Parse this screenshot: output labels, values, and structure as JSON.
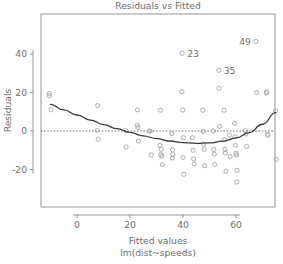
{
  "chart_data": {
    "type": "scatter",
    "title": "Residuals vs Fitted",
    "xlabel": "Fitted values",
    "xlabel_line2": "lm(dist~speeds)",
    "ylabel": "Residuals",
    "xlim": [
      -12,
      76
    ],
    "ylim": [
      -35,
      50
    ],
    "xticks": [
      0,
      20,
      40,
      60
    ],
    "ytick_labels": [
      "40",
      "20",
      "0",
      "-20"
    ],
    "yticks": [
      40,
      20,
      0,
      -20
    ],
    "grid": false,
    "legend": null,
    "zero_line": {
      "y": 0,
      "style": "dashed",
      "color": "#4d4d4d"
    },
    "point_color": "#9a9a9a",
    "curve_color": "#3a3a3a",
    "axis_color": "#8a8a8a",
    "x": [
      -10.4,
      -10.4,
      -9.8,
      7.8,
      7.6,
      8.0,
      18.5,
      18.4,
      22.8,
      22.7,
      23.0,
      23.2,
      27.3,
      27.6,
      28.0,
      31.5,
      31.3,
      31.8,
      31.6,
      32.0,
      32.2,
      35.8,
      36.0,
      36.2,
      36.0,
      39.7,
      39.6,
      39.9,
      40.1,
      40.0,
      40.3,
      43.5,
      43.8,
      44.0,
      44.2,
      47.5,
      47.6,
      47.8,
      48.0,
      48.2,
      51.5,
      51.6,
      51.8,
      52.0,
      53.5,
      53.6,
      53.8,
      55.5,
      55.6,
      55.8,
      56.0,
      56.2,
      57.5,
      57.8,
      59.5,
      59.6,
      59.8,
      60.0,
      60.2,
      60.4,
      60.3,
      63.5,
      63.8,
      64.0,
      67.5,
      67.8,
      71.5,
      71.6,
      71.8,
      72.0,
      75.0,
      75.2
    ],
    "y": [
      19.5,
      18.4,
      11.0,
      13.2,
      0.3,
      -4.3,
      -8.3,
      0.2,
      11.0,
      3.0,
      2.0,
      -5.2,
      0.1,
      -0.2,
      -12.5,
      10.8,
      -7.5,
      -9.5,
      -12.2,
      -13.0,
      -17.5,
      -1.3,
      -9.8,
      -12.3,
      -14.0,
      40.4,
      20.4,
      10.9,
      -3.5,
      -13.8,
      -22.5,
      -3.5,
      -10.0,
      -14.5,
      -17.0,
      10.8,
      -0.2,
      -6.8,
      -9.5,
      -18.0,
      0.0,
      -9.6,
      -12.0,
      -17.4,
      31.5,
      22.2,
      2.4,
      10.8,
      -4.5,
      -9.5,
      -11.5,
      -21.0,
      -2.0,
      -13.2,
      4.0,
      -3.0,
      -7.5,
      -11.6,
      -12.5,
      -20.5,
      -26.5,
      0.2,
      -1.5,
      -8.0,
      46.5,
      20.0,
      20.2,
      19.8,
      -1.7,
      -2.2,
      10.5,
      -14.7
    ],
    "curve": [
      {
        "x": -10.0,
        "y": 13.8
      },
      {
        "x": -5.0,
        "y": 11.0
      },
      {
        "x": 0.0,
        "y": 8.3
      },
      {
        "x": 5.0,
        "y": 5.7
      },
      {
        "x": 10.0,
        "y": 3.3
      },
      {
        "x": 15.0,
        "y": 1.2
      },
      {
        "x": 20.0,
        "y": -0.7
      },
      {
        "x": 25.0,
        "y": -2.5
      },
      {
        "x": 30.0,
        "y": -4.0
      },
      {
        "x": 35.0,
        "y": -5.2
      },
      {
        "x": 40.0,
        "y": -6.0
      },
      {
        "x": 45.0,
        "y": -6.4
      },
      {
        "x": 50.0,
        "y": -6.2
      },
      {
        "x": 55.0,
        "y": -5.3
      },
      {
        "x": 60.0,
        "y": -3.6
      },
      {
        "x": 65.0,
        "y": -0.8
      },
      {
        "x": 70.0,
        "y": 3.5
      },
      {
        "x": 75.0,
        "y": 9.5
      }
    ],
    "labeled_points": [
      {
        "label": "23",
        "x": 39.7,
        "y": 40.4
      },
      {
        "label": "35",
        "x": 53.5,
        "y": 31.5
      },
      {
        "label": "49",
        "x": 67.5,
        "y": 46.5
      }
    ]
  }
}
